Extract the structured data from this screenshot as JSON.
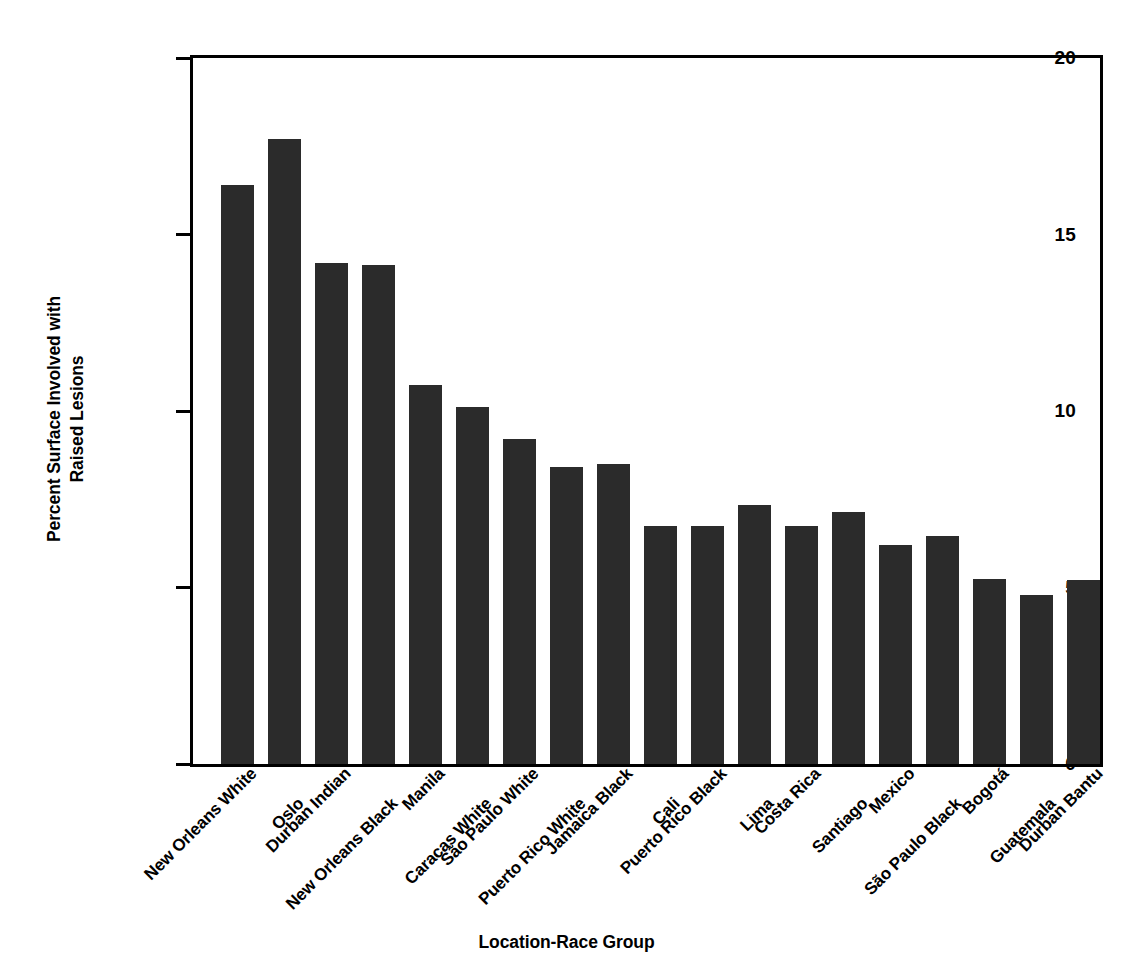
{
  "chart_data": {
    "type": "bar",
    "title": "",
    "xlabel": "Location-Race Group",
    "ylabel_line1": "Percent Surface Involved with",
    "ylabel_line2": "Raised Lesions",
    "ylabel": "Percent Surface Involved with Raised Lesions",
    "ylim": [
      0,
      20
    ],
    "yticks": [
      0,
      5,
      10,
      15,
      20
    ],
    "ytick_labels": [
      "0",
      "5",
      "10",
      "15",
      "20"
    ],
    "grid": false,
    "legend": "none",
    "bar_color": "#2b2b2b",
    "axis_color": "#000000",
    "categories": [
      "New Orleans White",
      "Oslo",
      "Durban Indian",
      "New Orleans Black",
      "Manila",
      "Caracas White",
      "São Paulo White",
      "Puerto Rico White",
      "Jamaica Black",
      "Cali",
      "Puerto Rico Black",
      "Lima",
      "Costa Rica",
      "Santiago",
      "Mexico",
      "São Paulo Black",
      "Bogotá",
      "Guatemala",
      "Durban Bantu"
    ],
    "values": [
      16.4,
      17.7,
      14.2,
      14.15,
      10.75,
      10.1,
      9.2,
      8.4,
      8.5,
      6.75,
      6.75,
      7.35,
      6.75,
      7.15,
      6.2,
      6.45,
      5.25,
      4.8,
      5.2
    ]
  }
}
